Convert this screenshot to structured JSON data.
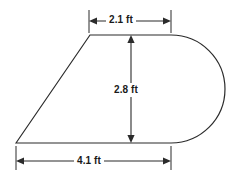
{
  "figure": {
    "units": "ft",
    "stroke_color": "#2b2b2b",
    "fill_color": "#ffffff",
    "background_color": "#ffffff",
    "dimensions": {
      "top": {
        "name": "top-width",
        "label": "2.1 ft",
        "value": 2.1,
        "unit": "ft",
        "orientation": "horizontal"
      },
      "height": {
        "name": "overall-height",
        "label": "2.8 ft",
        "value": 2.8,
        "unit": "ft",
        "orientation": "vertical"
      },
      "bottom": {
        "name": "bottom-width",
        "label": "4.1 ft",
        "value": 4.1,
        "unit": "ft",
        "orientation": "horizontal"
      }
    }
  }
}
